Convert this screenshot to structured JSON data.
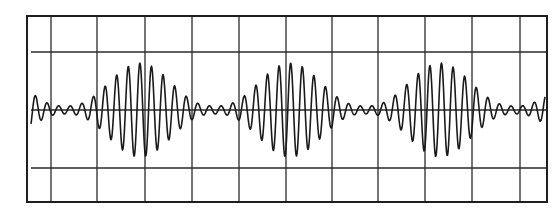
{
  "figure": {
    "type": "oscilloscope-trace"
  },
  "grid": {
    "left": 27,
    "top": 16,
    "right": 547,
    "bottom": 202,
    "vertical_lines_x": [
      51,
      97,
      145,
      192,
      239,
      286,
      332,
      378,
      425,
      472,
      520
    ],
    "horizontal_lines_y": [
      52,
      110,
      168
    ],
    "horizontal_inset_left": 31,
    "line_color": "#2a2a2a",
    "border_color": "#1e1e1e"
  },
  "waveform": {
    "color": "#1a1a1a",
    "baseline_y": 110,
    "x_start": 31,
    "x_end": 545,
    "carrier_period_px": 11.6,
    "carrier_phase": 1.2,
    "envelope_period_px": 150,
    "envelope_peak_x": 140,
    "max_amplitude_px": 47,
    "min_amplitude_px": 4,
    "stroke_width": 1.6
  },
  "chart_data": {
    "type": "line",
    "title": "",
    "xlabel": "",
    "ylabel": "",
    "grid": true,
    "divisions": {
      "horizontal": 11,
      "vertical": 3
    },
    "signal": "amplitude-modulated sinusoid (beats)",
    "bursts": 3,
    "burst_center_x_px": [
      140,
      290,
      440
    ],
    "envelope_null_x_px": [
      70,
      215,
      365,
      515
    ],
    "carrier_cycles_per_burst": 13
  }
}
